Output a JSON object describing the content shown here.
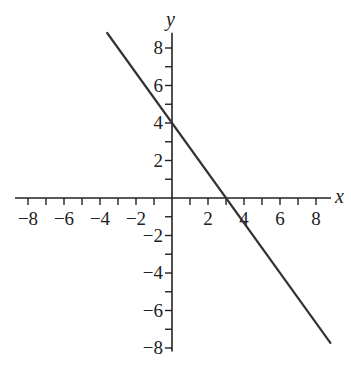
{
  "chart_data": {
    "type": "line",
    "title": "",
    "xlabel": "x",
    "ylabel": "y",
    "xlim": [
      -8.5,
      8.5
    ],
    "ylim": [
      -8.5,
      8.5
    ],
    "grid": false,
    "x_tick_labels": [
      -8,
      -6,
      -4,
      -2,
      2,
      4,
      6,
      8
    ],
    "y_tick_labels": [
      8,
      6,
      4,
      2,
      -2,
      -4,
      -6,
      -8
    ],
    "minor_tick_step": 1,
    "series": [
      {
        "name": "y = -4/3 x + 4",
        "slope": -1.3333,
        "intercept": 4,
        "x": [
          -3.6,
          8.8
        ],
        "y": [
          8.8,
          -7.73
        ],
        "color": "#333333"
      }
    ],
    "annotations": []
  },
  "layout": {
    "origin_px": [
      172,
      198
    ],
    "unit_x_px": 18,
    "unit_y_px": 18.75,
    "axis_color": "#222222",
    "line_color": "#333333"
  }
}
